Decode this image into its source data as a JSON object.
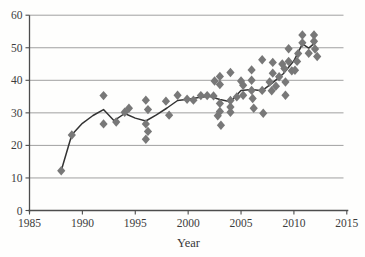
{
  "figure": {
    "background": "#fefefd",
    "title": "",
    "caption": ""
  },
  "chart_data": {
    "type": "scatter",
    "title": "",
    "xlabel": "Year",
    "ylabel": "",
    "xlim": [
      1985,
      2015
    ],
    "ylim": [
      0,
      60
    ],
    "x_ticks": [
      "1985",
      "1990",
      "1995",
      "2000",
      "2005",
      "2010",
      "2015"
    ],
    "x_tick_values": [
      1985,
      1990,
      1995,
      2000,
      2005,
      2010,
      2015
    ],
    "y_ticks": [
      "0",
      "10",
      "20",
      "30",
      "40",
      "50",
      "60"
    ],
    "y_tick_values": [
      0,
      10,
      20,
      30,
      40,
      50,
      60
    ],
    "grid": "horizontal-gridlines",
    "legend": "none",
    "marker": "diamond",
    "colors": {
      "marker": "#787878",
      "trend_line": "#333333",
      "gridline": "#a0a0a0",
      "axis": "#4d4d4d",
      "text": "#3c3c3c"
    },
    "series": [
      {
        "name": "observations",
        "type": "scatter",
        "points": [
          [
            1988,
            12.2
          ],
          [
            1989,
            23.2
          ],
          [
            1992,
            35.3
          ],
          [
            1992,
            26.6
          ],
          [
            1993.2,
            27.2
          ],
          [
            1994,
            30.2
          ],
          [
            1994.4,
            31.4
          ],
          [
            1996,
            33.9
          ],
          [
            1996,
            26.6
          ],
          [
            1996,
            21.9
          ],
          [
            1996.2,
            31.0
          ],
          [
            1996.2,
            24.3
          ],
          [
            1997.9,
            33.6
          ],
          [
            1998.2,
            29.3
          ],
          [
            1999,
            35.4
          ],
          [
            1999.9,
            34.2
          ],
          [
            2000.5,
            33.9
          ],
          [
            2001.2,
            35.3
          ],
          [
            2001.8,
            35.3
          ],
          [
            2002.4,
            35.2
          ],
          [
            2002.5,
            39.8
          ],
          [
            2002.8,
            29.1
          ],
          [
            2003,
            41.2
          ],
          [
            2003,
            38.7
          ],
          [
            2003,
            32.9
          ],
          [
            2003,
            30.4
          ],
          [
            2003.1,
            26.2
          ],
          [
            2004,
            42.4
          ],
          [
            2004,
            33.8
          ],
          [
            2004,
            31.8
          ],
          [
            2004,
            30.2
          ],
          [
            2004.6,
            34.9
          ],
          [
            2005,
            39.8
          ],
          [
            2005.2,
            38.5
          ],
          [
            2005.2,
            35.4
          ],
          [
            2006,
            43.2
          ],
          [
            2006,
            40.0
          ],
          [
            2006,
            36.9
          ],
          [
            2006.1,
            34.4
          ],
          [
            2006.2,
            31.4
          ],
          [
            2007,
            46.3
          ],
          [
            2007,
            36.9
          ],
          [
            2007.1,
            29.9
          ],
          [
            2007.7,
            39.5
          ],
          [
            2007.9,
            36.8
          ],
          [
            2008,
            45.5
          ],
          [
            2008,
            42.2
          ],
          [
            2008.3,
            38.2
          ],
          [
            2008.6,
            41.1
          ],
          [
            2008.9,
            45.0
          ],
          [
            2009.1,
            43.6
          ],
          [
            2009.2,
            39.5
          ],
          [
            2009.2,
            35.4
          ],
          [
            2009.5,
            49.7
          ],
          [
            2009.5,
            45.8
          ],
          [
            2009.8,
            42.9
          ],
          [
            2010.1,
            43.1
          ],
          [
            2010.3,
            45.8
          ],
          [
            2010.4,
            48.2
          ],
          [
            2010.8,
            53.9
          ],
          [
            2010.8,
            51.5
          ],
          [
            2011.4,
            48.3
          ],
          [
            2011.9,
            53.9
          ],
          [
            2011.9,
            52.0
          ],
          [
            2012,
            49.6
          ],
          [
            2012.2,
            47.3
          ]
        ]
      },
      {
        "name": "trend",
        "type": "line",
        "points": [
          [
            1988,
            12.2
          ],
          [
            1989,
            23.3
          ],
          [
            1990,
            26.8
          ],
          [
            1991,
            29.2
          ],
          [
            1992,
            31.0
          ],
          [
            1993,
            27.6
          ],
          [
            1994,
            29.8
          ],
          [
            1995,
            28.4
          ],
          [
            1996,
            27.5
          ],
          [
            1997,
            29.4
          ],
          [
            1998,
            31.5
          ],
          [
            1999,
            33.8
          ],
          [
            2000,
            34.2
          ],
          [
            2001,
            34.7
          ],
          [
            2002,
            35.1
          ],
          [
            2003,
            34.1
          ],
          [
            2004,
            33.4
          ],
          [
            2005,
            36.9
          ],
          [
            2006,
            37.2
          ],
          [
            2007,
            36.8
          ],
          [
            2008,
            39.3
          ],
          [
            2009,
            42.0
          ],
          [
            2010,
            46.0
          ],
          [
            2010.8,
            51.2
          ],
          [
            2011.4,
            49.9
          ],
          [
            2012.1,
            51.8
          ]
        ]
      }
    ]
  }
}
